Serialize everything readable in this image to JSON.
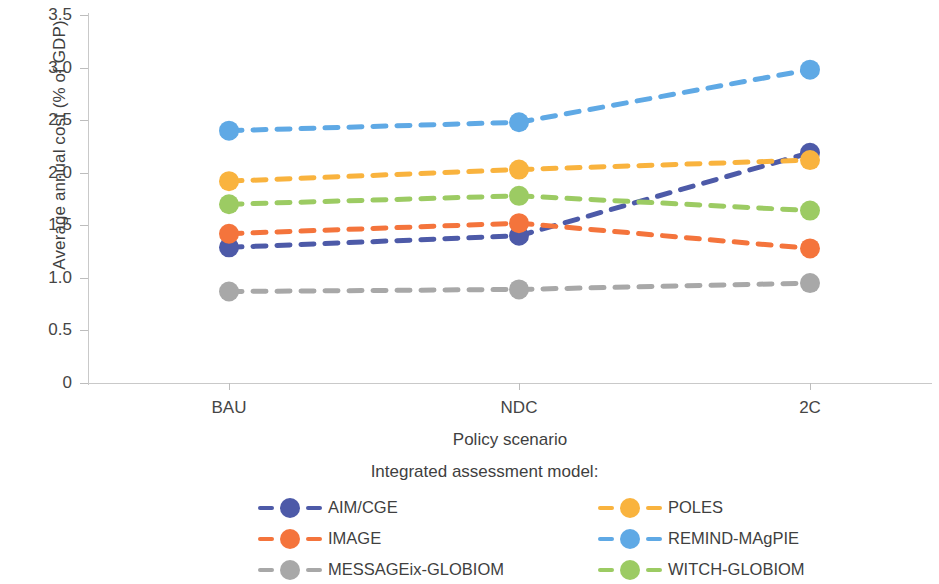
{
  "chart_data": {
    "type": "line",
    "title": "",
    "xlabel": "Policy scenario",
    "ylabel": "Average annual cost (% of GDP)",
    "categories": [
      "BAU",
      "NDC",
      "2C"
    ],
    "ylim": [
      0,
      3.5
    ],
    "yticks": [
      "0",
      "0.5",
      "1.0",
      "1.5",
      "2.0",
      "2.5",
      "3.0",
      "3.5"
    ],
    "ytick_values": [
      0,
      0.5,
      1.0,
      1.5,
      2.0,
      2.5,
      3.0,
      3.5
    ],
    "grid": false,
    "legend_position": "bottom",
    "legend_title": "Integrated assessment model:",
    "line_style": "dashed",
    "marker": "circle",
    "series": [
      {
        "name": "AIM/CGE",
        "color": "#4d5aa8",
        "values": [
          1.29,
          1.4,
          2.19
        ]
      },
      {
        "name": "IMAGE",
        "color": "#f4743c",
        "values": [
          1.42,
          1.52,
          1.28
        ]
      },
      {
        "name": "MESSAGEix-GLOBIOM",
        "color": "#a8a8a8",
        "values": [
          0.87,
          0.89,
          0.95
        ]
      },
      {
        "name": "POLES",
        "color": "#f9b33e",
        "values": [
          1.92,
          2.03,
          2.12
        ]
      },
      {
        "name": "REMIND-MAgPIE",
        "color": "#5fa9e5",
        "values": [
          2.4,
          2.48,
          2.98
        ]
      },
      {
        "name": "WITCH-GLOBIOM",
        "color": "#9ccb63",
        "values": [
          1.7,
          1.78,
          1.64
        ]
      }
    ]
  },
  "legend": {
    "title": "Integrated assessment model:",
    "order": [
      0,
      3,
      1,
      4,
      2,
      5
    ]
  },
  "axes": {
    "axis_color": "#c9c9c9",
    "tick_color": "#bdbdbd",
    "text_color": "#454545"
  }
}
